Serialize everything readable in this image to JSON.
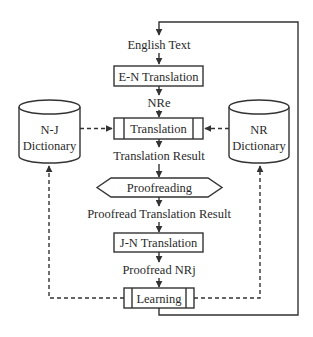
{
  "diagram": {
    "type": "flowchart",
    "nodes": {
      "english_text": "English Text",
      "en_translation": "E-N Translation",
      "nre": "NRe",
      "translation": "Translation",
      "translation_result": "Translation Result",
      "proofreading": "Proofreading",
      "proofread_translation_result": "Proofread Translation Result",
      "jn_translation": "J-N Translation",
      "proofread_nrj": "Proofread NRj",
      "learning": "Learning",
      "nj_dictionary": {
        "line1": "N-J",
        "line2": "Dictionary"
      },
      "nr_dictionary": {
        "line1": "NR",
        "line2": "Dictionary"
      }
    },
    "edges": [
      {
        "from": "English Text",
        "to": "E-N Translation",
        "style": "solid"
      },
      {
        "from": "E-N Translation",
        "to": "NRe",
        "style": "solid"
      },
      {
        "from": "NRe",
        "to": "Translation",
        "style": "solid"
      },
      {
        "from": "N-J Dictionary",
        "to": "Translation",
        "style": "dashed"
      },
      {
        "from": "NR Dictionary",
        "to": "Translation",
        "style": "dashed"
      },
      {
        "from": "Translation",
        "to": "Translation Result",
        "style": "solid"
      },
      {
        "from": "Translation Result",
        "to": "Proofreading",
        "style": "solid"
      },
      {
        "from": "Proofreading",
        "to": "Proofread Translation Result",
        "style": "solid"
      },
      {
        "from": "Proofread Translation Result",
        "to": "J-N Translation",
        "style": "solid"
      },
      {
        "from": "J-N Translation",
        "to": "Proofread NRj",
        "style": "solid"
      },
      {
        "from": "Proofread NRj",
        "to": "Learning",
        "style": "solid"
      },
      {
        "from": "Learning",
        "to": "N-J Dictionary",
        "style": "dashed"
      },
      {
        "from": "Learning",
        "to": "NR Dictionary",
        "style": "dashed"
      },
      {
        "from": "Learning",
        "to": "English Text",
        "style": "solid",
        "note": "feedback loop"
      }
    ],
    "colors": {
      "stroke": "#333333",
      "text": "#2a2a2a",
      "background": "#ffffff"
    }
  }
}
